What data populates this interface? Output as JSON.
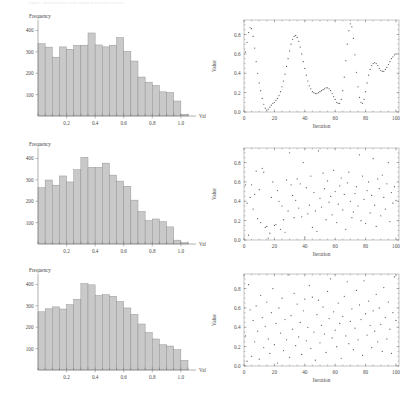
{
  "header": {
    "text": "Figure: distributions and sampled iteration traces"
  },
  "figure": {
    "name": "six-panel-statistics-figure",
    "rows": 3,
    "columns": 2
  },
  "axis_labels": {
    "hist_x": "Value",
    "hist_y": "Frequency",
    "scatter_x": "Iteration",
    "scatter_y": "Value"
  },
  "chart_data": [
    {
      "id": "histogram-1",
      "type": "bar",
      "title": "",
      "xlabel": "Value",
      "ylabel": "Frequency",
      "xlim": [
        0.0,
        1.05
      ],
      "ylim": [
        0,
        430
      ],
      "xticks": [
        0.2,
        0.4,
        0.6,
        0.8,
        1.0
      ],
      "xtick_labels": [
        "0.2",
        "0.4",
        "0.6",
        "0.8",
        "1.0"
      ],
      "yticks": [
        100,
        200,
        300,
        400
      ],
      "ytick_labels": [
        "100",
        "200",
        "300",
        "400"
      ],
      "grid": false,
      "legend": null,
      "bin_width": 0.05,
      "categories": [
        "0.00",
        "0.05",
        "0.10",
        "0.15",
        "0.20",
        "0.25",
        "0.30",
        "0.35",
        "0.40",
        "0.45",
        "0.50",
        "0.55",
        "0.60",
        "0.65",
        "0.70",
        "0.75",
        "0.80",
        "0.85",
        "0.90",
        "0.95",
        "1.00"
      ],
      "values": [
        338,
        322,
        275,
        323,
        312,
        330,
        331,
        388,
        332,
        323,
        331,
        366,
        302,
        257,
        182,
        158,
        143,
        113,
        110,
        70,
        8
      ]
    },
    {
      "id": "scatter-1",
      "type": "scatter",
      "title": "",
      "xlabel": "Iteration",
      "ylabel": "Value",
      "xlim": [
        0,
        102
      ],
      "ylim": [
        0.0,
        0.95
      ],
      "xticks": [
        0,
        20,
        40,
        60,
        80,
        100
      ],
      "xtick_labels": [
        "0",
        "20",
        "40",
        "60",
        "80",
        "100"
      ],
      "yticks": [
        0.0,
        0.2,
        0.4,
        0.6,
        0.8
      ],
      "ytick_labels": [
        "0.0",
        "0.2",
        "0.4",
        "0.6",
        "0.8"
      ],
      "grid": false,
      "legend": null,
      "pattern": "smooth-oscillating",
      "x": [
        1,
        2,
        3,
        4,
        5,
        6,
        7,
        8,
        9,
        10,
        11,
        12,
        13,
        14,
        15,
        16,
        17,
        18,
        19,
        20,
        21,
        22,
        23,
        24,
        25,
        26,
        27,
        28,
        29,
        30,
        31,
        32,
        33,
        34,
        35,
        36,
        37,
        38,
        39,
        40,
        41,
        42,
        43,
        44,
        45,
        46,
        47,
        48,
        49,
        50,
        51,
        52,
        53,
        54,
        55,
        56,
        57,
        58,
        59,
        60,
        61,
        62,
        63,
        64,
        65,
        66,
        67,
        68,
        69,
        70,
        71,
        72,
        73,
        74,
        75,
        76,
        77,
        78,
        79,
        80,
        81,
        82,
        83,
        84,
        85,
        86,
        87,
        88,
        89,
        90,
        91,
        92,
        93,
        94,
        95,
        96,
        97,
        98,
        99,
        100
      ],
      "y": [
        0.62,
        0.72,
        0.82,
        0.87,
        0.86,
        0.78,
        0.66,
        0.52,
        0.4,
        0.3,
        0.22,
        0.14,
        0.08,
        0.04,
        0.02,
        0.03,
        0.05,
        0.07,
        0.09,
        0.1,
        0.12,
        0.14,
        0.17,
        0.21,
        0.26,
        0.32,
        0.39,
        0.47,
        0.55,
        0.63,
        0.7,
        0.75,
        0.78,
        0.79,
        0.77,
        0.73,
        0.67,
        0.6,
        0.52,
        0.45,
        0.38,
        0.32,
        0.27,
        0.24,
        0.21,
        0.2,
        0.19,
        0.19,
        0.2,
        0.21,
        0.22,
        0.23,
        0.24,
        0.25,
        0.25,
        0.24,
        0.22,
        0.19,
        0.16,
        0.13,
        0.1,
        0.09,
        0.09,
        0.13,
        0.22,
        0.36,
        0.53,
        0.7,
        0.84,
        0.91,
        0.88,
        0.76,
        0.59,
        0.41,
        0.26,
        0.15,
        0.1,
        0.09,
        0.13,
        0.21,
        0.3,
        0.38,
        0.44,
        0.48,
        0.5,
        0.51,
        0.5,
        0.48,
        0.45,
        0.43,
        0.42,
        0.42,
        0.44,
        0.46,
        0.49,
        0.52,
        0.55,
        0.57,
        0.59,
        0.6
      ]
    },
    {
      "id": "histogram-2",
      "type": "bar",
      "title": "",
      "xlabel": "Value",
      "ylabel": "Frequency",
      "xlim": [
        0.0,
        1.05
      ],
      "ylim": [
        0,
        430
      ],
      "xticks": [
        0.2,
        0.4,
        0.6,
        0.8,
        1.0
      ],
      "xtick_labels": [
        "0.2",
        "0.4",
        "0.6",
        "0.8",
        "1.0"
      ],
      "yticks": [
        100,
        200,
        300,
        400
      ],
      "ytick_labels": [
        "100",
        "200",
        "300",
        "400"
      ],
      "grid": false,
      "legend": null,
      "bin_width": 0.05,
      "categories": [
        "0.00",
        "0.05",
        "0.10",
        "0.15",
        "0.20",
        "0.25",
        "0.30",
        "0.35",
        "0.40",
        "0.45",
        "0.50",
        "0.55",
        "0.60",
        "0.65",
        "0.70",
        "0.75",
        "0.80",
        "0.85",
        "0.90",
        "0.95",
        "1.00"
      ],
      "values": [
        263,
        299,
        275,
        318,
        290,
        347,
        405,
        358,
        358,
        378,
        322,
        294,
        270,
        205,
        152,
        110,
        117,
        104,
        80,
        18,
        6
      ]
    },
    {
      "id": "scatter-2",
      "type": "scatter",
      "title": "",
      "xlabel": "Iteration",
      "ylabel": "Value",
      "xlim": [
        0,
        102
      ],
      "ylim": [
        0.0,
        0.95
      ],
      "xticks": [
        0,
        20,
        40,
        60,
        80,
        100
      ],
      "xtick_labels": [
        "0",
        "20",
        "40",
        "60",
        "80",
        "100"
      ],
      "yticks": [
        0.0,
        0.2,
        0.4,
        0.6,
        0.8
      ],
      "ytick_labels": [
        "0.0",
        "0.2",
        "0.4",
        "0.6",
        "0.8"
      ],
      "grid": false,
      "legend": null,
      "pattern": "uniform-random",
      "x": [
        1,
        2,
        3,
        4,
        5,
        6,
        7,
        8,
        9,
        10,
        11,
        12,
        13,
        14,
        15,
        16,
        17,
        18,
        19,
        20,
        21,
        22,
        23,
        24,
        25,
        26,
        27,
        28,
        29,
        30,
        31,
        32,
        33,
        34,
        35,
        36,
        37,
        38,
        39,
        40,
        41,
        42,
        43,
        44,
        45,
        46,
        47,
        48,
        49,
        50,
        51,
        52,
        53,
        54,
        55,
        56,
        57,
        58,
        59,
        60,
        61,
        62,
        63,
        64,
        65,
        66,
        67,
        68,
        69,
        70,
        71,
        72,
        73,
        74,
        75,
        76,
        77,
        78,
        79,
        80,
        81,
        82,
        83,
        84,
        85,
        86,
        87,
        88,
        89,
        90,
        91,
        92,
        93,
        94,
        95,
        96,
        97,
        98,
        99,
        100
      ],
      "y": [
        0.57,
        0.38,
        0.05,
        0.44,
        0.57,
        0.32,
        0.47,
        0.71,
        0.22,
        0.52,
        0.18,
        0.74,
        0.7,
        0.13,
        0.14,
        0.02,
        0.07,
        0.44,
        0.6,
        0.15,
        0.16,
        0.51,
        0.4,
        0.11,
        0.35,
        0.21,
        0.08,
        0.62,
        0.3,
        0.9,
        0.57,
        0.46,
        0.23,
        0.41,
        0.63,
        0.33,
        0.58,
        0.24,
        0.8,
        0.03,
        0.54,
        0.27,
        0.36,
        0.66,
        0.13,
        0.49,
        0.3,
        0.09,
        0.92,
        0.43,
        0.34,
        0.69,
        0.53,
        0.21,
        0.61,
        0.39,
        0.45,
        0.26,
        0.72,
        0.5,
        0.18,
        0.37,
        0.56,
        0.64,
        0.31,
        0.47,
        0.11,
        0.59,
        0.7,
        0.4,
        0.23,
        0.29,
        0.48,
        0.55,
        0.35,
        0.88,
        0.2,
        0.66,
        0.42,
        0.17,
        0.51,
        0.6,
        0.28,
        0.46,
        0.84,
        0.36,
        0.14,
        0.63,
        0.53,
        0.25,
        0.67,
        0.44,
        0.32,
        0.58,
        0.8,
        0.19,
        0.49,
        0.38,
        0.55,
        0.41
      ]
    },
    {
      "id": "histogram-3",
      "type": "bar",
      "title": "",
      "xlabel": "Value",
      "ylabel": "Frequency",
      "xlim": [
        0.0,
        1.05
      ],
      "ylim": [
        0,
        430
      ],
      "xticks": [
        0.2,
        0.4,
        0.6,
        0.8,
        1.0
      ],
      "xtick_labels": [
        "0.2",
        "0.4",
        "0.6",
        "0.8",
        "1.0"
      ],
      "yticks": [
        100,
        200,
        300,
        400
      ],
      "ytick_labels": [
        "100",
        "200",
        "300",
        "400"
      ],
      "grid": false,
      "legend": null,
      "bin_width": 0.05,
      "categories": [
        "0.00",
        "0.05",
        "0.10",
        "0.15",
        "0.20",
        "0.25",
        "0.30",
        "0.35",
        "0.40",
        "0.45",
        "0.50",
        "0.55",
        "0.60",
        "0.65",
        "0.70",
        "0.75",
        "0.80",
        "0.85",
        "0.90",
        "0.95",
        "1.00"
      ],
      "values": [
        272,
        286,
        295,
        285,
        305,
        330,
        404,
        398,
        348,
        352,
        345,
        320,
        290,
        260,
        215,
        175,
        145,
        118,
        112,
        95,
        45
      ]
    },
    {
      "id": "scatter-3",
      "type": "scatter",
      "title": "",
      "xlabel": "Iteration",
      "ylabel": "Value",
      "xlim": [
        0,
        102
      ],
      "ylim": [
        0.0,
        0.95
      ],
      "xticks": [
        0,
        20,
        40,
        60,
        80,
        100
      ],
      "xtick_labels": [
        "0",
        "20",
        "40",
        "60",
        "80",
        "100"
      ],
      "yticks": [
        0.0,
        0.2,
        0.4,
        0.6,
        0.8
      ],
      "ytick_labels": [
        "0.0",
        "0.2",
        "0.4",
        "0.6",
        "0.8"
      ],
      "grid": false,
      "legend": null,
      "pattern": "uniform-random",
      "x": [
        1,
        2,
        3,
        4,
        5,
        6,
        7,
        8,
        9,
        10,
        11,
        12,
        13,
        14,
        15,
        16,
        17,
        18,
        19,
        20,
        21,
        22,
        23,
        24,
        25,
        26,
        27,
        28,
        29,
        30,
        31,
        32,
        33,
        34,
        35,
        36,
        37,
        38,
        39,
        40,
        41,
        42,
        43,
        44,
        45,
        46,
        47,
        48,
        49,
        50,
        51,
        52,
        53,
        54,
        55,
        56,
        57,
        58,
        59,
        60,
        61,
        62,
        63,
        64,
        65,
        66,
        67,
        68,
        69,
        70,
        71,
        72,
        73,
        74,
        75,
        76,
        77,
        78,
        79,
        80,
        81,
        82,
        83,
        84,
        85,
        86,
        87,
        88,
        89,
        90,
        91,
        92,
        93,
        94,
        95,
        96,
        97,
        98,
        99,
        100
      ],
      "y": [
        0.31,
        0.05,
        0.84,
        0.58,
        0.1,
        0.47,
        0.25,
        0.62,
        0.36,
        0.07,
        0.73,
        0.5,
        0.19,
        0.41,
        0.66,
        0.28,
        0.13,
        0.55,
        0.8,
        0.22,
        0.44,
        0.03,
        0.6,
        0.34,
        0.7,
        0.16,
        0.48,
        0.27,
        0.94,
        0.09,
        0.52,
        0.38,
        0.75,
        0.21,
        0.64,
        0.3,
        0.45,
        0.12,
        0.57,
        0.69,
        0.26,
        0.4,
        0.83,
        0.18,
        0.71,
        0.35,
        0.06,
        0.53,
        0.68,
        0.24,
        0.42,
        0.61,
        0.33,
        0.14,
        0.77,
        0.49,
        0.9,
        0.29,
        0.56,
        0.37,
        0.2,
        0.65,
        0.44,
        0.08,
        0.51,
        0.72,
        0.31,
        0.87,
        0.23,
        0.46,
        0.59,
        0.17,
        0.39,
        0.78,
        0.27,
        0.63,
        0.48,
        0.11,
        0.88,
        0.54,
        0.32,
        0.67,
        0.42,
        0.19,
        0.57,
        0.36,
        0.74,
        0.25,
        0.6,
        0.43,
        0.15,
        0.81,
        0.5,
        0.28,
        0.66,
        0.38,
        0.13,
        0.55,
        0.92,
        0.47
      ]
    }
  ]
}
